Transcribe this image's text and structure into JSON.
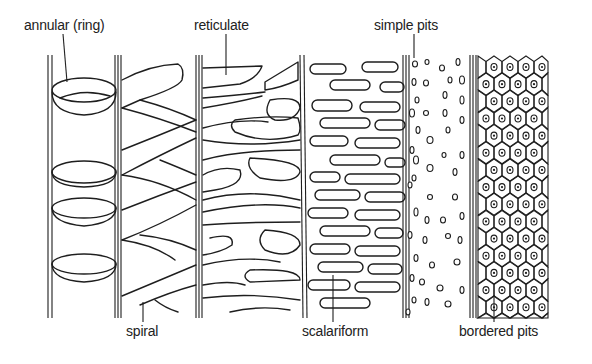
{
  "diagram": {
    "labels": [
      {
        "id": "annular",
        "text": "annular (ring)",
        "x": 24,
        "y": 17
      },
      {
        "id": "reticulate",
        "text": "reticulate",
        "x": 194,
        "y": 17
      },
      {
        "id": "simple_pits",
        "text": "simple pits",
        "x": 374,
        "y": 17
      },
      {
        "id": "spiral",
        "text": "spiral",
        "x": 126,
        "y": 323
      },
      {
        "id": "scalariform",
        "text": "scalariform",
        "x": 302,
        "y": 323
      },
      {
        "id": "bordered_pits",
        "text": "bordered pits",
        "x": 459,
        "y": 323
      }
    ],
    "vessels": [
      {
        "id": "annular",
        "name": "annular (ring)"
      },
      {
        "id": "spiral",
        "name": "spiral"
      },
      {
        "id": "reticulate",
        "name": "reticulate"
      },
      {
        "id": "scalariform",
        "name": "scalariform"
      },
      {
        "id": "simple_pits",
        "name": "simple pits"
      },
      {
        "id": "bordered_pits",
        "name": "bordered pits"
      }
    ],
    "colors": {
      "line": "#1e1e1e",
      "background": "#ffffff",
      "text": "#222222"
    }
  }
}
